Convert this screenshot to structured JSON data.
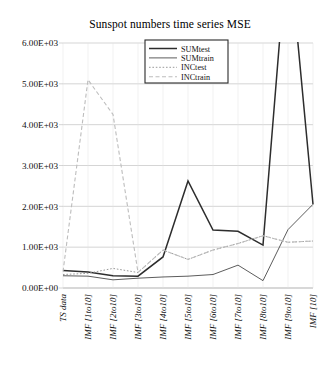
{
  "chart_data": {
    "type": "line",
    "title": "Sunspot numbers time series MSE",
    "xlabel": "",
    "ylabel": "",
    "grid": true,
    "legend_position": "top-center",
    "ylim": [
      0,
      6000
    ],
    "ytick_labels": [
      "0.00E+00",
      "1.00E+03",
      "2.00E+03",
      "3.00E+03",
      "4.00E+03",
      "5.00E+03",
      "6.00E+03"
    ],
    "ytick_values": [
      0,
      1000,
      2000,
      3000,
      4000,
      5000,
      6000
    ],
    "categories": [
      "TS data",
      "IMF [1to10]",
      "IMF [2to10]",
      "IMF [3to10]",
      "IMF [4to10]",
      "IMF [5to10]",
      "IMF [6to10]",
      "IMF [7to10]",
      "IMF [8to10]",
      "IMF [9to10]",
      "IMF [10]"
    ],
    "series": [
      {
        "name": "SUMtest",
        "style": "solid",
        "color": "#2d2d2d",
        "width": 1.5,
        "values": [
          430,
          390,
          300,
          290,
          760,
          2620,
          1420,
          1390,
          1050,
          8600,
          2050
        ]
      },
      {
        "name": "SUMtrain",
        "style": "solid",
        "color": "#4a4a4a",
        "width": 0.9,
        "values": [
          300,
          290,
          200,
          240,
          270,
          290,
          330,
          560,
          180,
          1430,
          2050
        ]
      },
      {
        "name": "INCtest",
        "style": "dotted",
        "color": "#9a9a9a",
        "width": 1.0,
        "values": [
          330,
          360,
          480,
          380,
          930,
          700,
          930,
          1090,
          1280,
          1120,
          1150
        ]
      },
      {
        "name": "INCtrain",
        "style": "dashed",
        "color": "#bdbdbd",
        "width": 1.1,
        "values": [
          400,
          5100,
          4250,
          380,
          930,
          700,
          930,
          1090,
          1280,
          1120,
          1150
        ]
      }
    ]
  }
}
